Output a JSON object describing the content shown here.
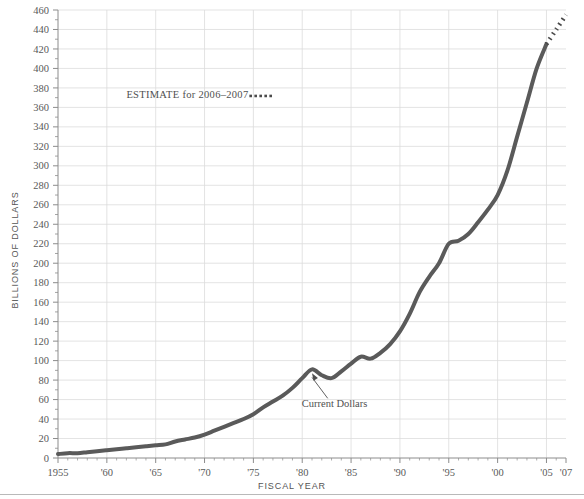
{
  "chart_data": {
    "type": "line",
    "title": "",
    "xlabel": "FISCAL YEAR",
    "ylabel": "BILLIONS OF DOLLARS",
    "xlim": [
      1955,
      2007
    ],
    "ylim": [
      0,
      460
    ],
    "ytick_step": 20,
    "grid": true,
    "legend_position": "none",
    "series": [
      {
        "name": "Current Dollars",
        "style": "solid",
        "color": "#5a5a5a",
        "x": [
          1955,
          1956,
          1957,
          1958,
          1959,
          1960,
          1961,
          1962,
          1963,
          1964,
          1965,
          1966,
          1967,
          1968,
          1969,
          1970,
          1971,
          1972,
          1973,
          1974,
          1975,
          1976,
          1977,
          1978,
          1979,
          1980,
          1981,
          1982,
          1983,
          1984,
          1985,
          1986,
          1987,
          1988,
          1989,
          1990,
          1991,
          1992,
          1993,
          1994,
          1995,
          1996,
          1997,
          1998,
          1999,
          2000,
          2001,
          2002,
          2003,
          2004,
          2005
        ],
        "values": [
          4,
          5,
          5,
          6,
          7,
          8,
          9,
          10,
          11,
          12,
          13,
          14,
          17,
          19,
          21,
          24,
          28,
          32,
          36,
          40,
          45,
          52,
          58,
          64,
          72,
          82,
          91,
          85,
          82,
          89,
          97,
          104,
          102,
          108,
          117,
          130,
          148,
          170,
          186,
          200,
          220,
          223,
          230,
          242,
          255,
          270,
          295,
          330,
          365,
          400,
          425
        ]
      },
      {
        "name": "ESTIMATE for 2006–2007",
        "style": "dotted",
        "color": "#4a4a4a",
        "x": [
          2005,
          2006,
          2007
        ],
        "values": [
          425,
          440,
          455
        ]
      }
    ],
    "xtick_labels": [
      "1955",
      "'60",
      "'65",
      "'70",
      "'75",
      "'80",
      "'85",
      "'90",
      "'95",
      "'00",
      "'05",
      "'07"
    ],
    "xtick_values": [
      1955,
      1960,
      1965,
      1970,
      1975,
      1980,
      1985,
      1990,
      1995,
      2000,
      2005,
      2007
    ],
    "ytick_labels": [
      "0",
      "20",
      "40",
      "60",
      "80",
      "100",
      "120",
      "140",
      "160",
      "180",
      "200",
      "220",
      "240",
      "260",
      "280",
      "300",
      "320",
      "340",
      "360",
      "380",
      "400",
      "420",
      "440",
      "460"
    ],
    "ytick_values": [
      0,
      20,
      40,
      60,
      80,
      100,
      120,
      140,
      160,
      180,
      200,
      220,
      240,
      260,
      280,
      300,
      320,
      340,
      360,
      380,
      400,
      420,
      440,
      460
    ],
    "annotations": [
      {
        "name": "current-dollars",
        "text": "Current Dollars",
        "point_x": 1981,
        "point_y": 91,
        "label_x": 1982.2,
        "label_y": 52
      },
      {
        "name": "estimate-note",
        "text": "ESTIMATE for 2006–2007",
        "label_x": 1962,
        "label_y": 370
      }
    ],
    "colors": {
      "line": "#5a5a5a",
      "grid": "#dcdcdc",
      "axis": "#8c8c8c",
      "text": "#4f4f4f",
      "background": "#ffffff"
    }
  }
}
